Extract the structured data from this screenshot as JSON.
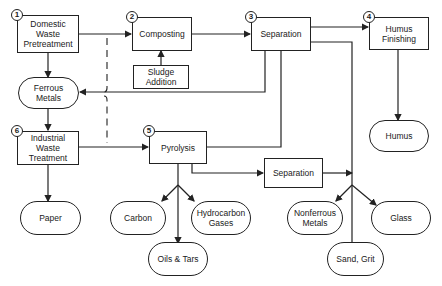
{
  "diagram": {
    "type": "process-flow",
    "processes": [
      {
        "id": "domestic",
        "step": "1",
        "label": "Domestic\nWaste\nPretreatment"
      },
      {
        "id": "composting",
        "step": "2",
        "label": "Composting"
      },
      {
        "id": "separation1",
        "step": "3",
        "label": "Separation"
      },
      {
        "id": "humus_finishing",
        "step": "4",
        "label": "Humus\nFinishing"
      },
      {
        "id": "pyrolysis",
        "step": "5",
        "label": "Pyrolysis"
      },
      {
        "id": "industrial",
        "step": "6",
        "label": "Industrial\nWaste\nTreatment"
      },
      {
        "id": "sludge",
        "label": "Sludge\nAddition"
      },
      {
        "id": "separation2",
        "label": "Separation"
      }
    ],
    "outputs": [
      {
        "id": "ferrous",
        "label": "Ferrous\nMetals"
      },
      {
        "id": "humus",
        "label": "Humus"
      },
      {
        "id": "paper",
        "label": "Paper"
      },
      {
        "id": "carbon",
        "label": "Carbon"
      },
      {
        "id": "hydrocarbon",
        "label": "Hydrocarbon\nGases"
      },
      {
        "id": "oils",
        "label": "Oils & Tars"
      },
      {
        "id": "nonferrous",
        "label": "Nonferrous\nMetals"
      },
      {
        "id": "glass",
        "label": "Glass"
      },
      {
        "id": "sand",
        "label": "Sand, Grit"
      }
    ],
    "edges": [
      [
        "domestic",
        "composting"
      ],
      [
        "composting",
        "separation1"
      ],
      [
        "sludge",
        "composting"
      ],
      [
        "separation1",
        "humus_finishing"
      ],
      [
        "humus_finishing",
        "humus"
      ],
      [
        "domestic",
        "ferrous"
      ],
      [
        "separation1",
        "ferrous"
      ],
      [
        "ferrous",
        "industrial"
      ],
      [
        "industrial",
        "paper"
      ],
      [
        "industrial",
        "pyrolysis"
      ],
      [
        "separation1",
        "pyrolysis"
      ],
      [
        "pyrolysis",
        "separation2"
      ],
      [
        "pyrolysis",
        "carbon"
      ],
      [
        "pyrolysis",
        "oils"
      ],
      [
        "pyrolysis",
        "hydrocarbon"
      ],
      [
        "separation1",
        "nonferrous"
      ],
      [
        "separation2",
        "nonferrous"
      ],
      [
        "separation1",
        "sand"
      ],
      [
        "separation1",
        "glass"
      ]
    ]
  }
}
